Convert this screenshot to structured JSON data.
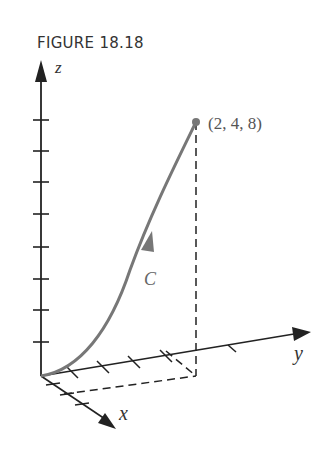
{
  "figure": {
    "title": "FIGURE 18.18",
    "axes": {
      "x": "x",
      "y": "y",
      "z": "z"
    },
    "curve_label": "C",
    "endpoint_label": "(2, 4, 8)",
    "endpoint": {
      "x": 2,
      "y": 4,
      "z": 8
    },
    "colors": {
      "axis": "#222222",
      "curve": "#777777",
      "text": "#333333"
    }
  }
}
